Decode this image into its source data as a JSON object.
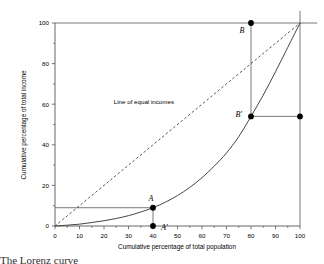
{
  "chart_data": {
    "type": "line",
    "title": "",
    "xlabel": "Cumulative percentage of total population",
    "ylabel": "Cumulative percentage of total income",
    "xlim": [
      0,
      100
    ],
    "ylim": [
      0,
      100
    ],
    "grid": false,
    "legend_position": "none",
    "xticks": [
      0,
      10,
      20,
      30,
      40,
      50,
      60,
      70,
      80,
      90,
      100
    ],
    "xtick_labels": [
      "0",
      "10",
      "20",
      "30",
      "40",
      "50",
      "60",
      "70",
      "80",
      "90",
      "100"
    ],
    "yticks": [
      0,
      20,
      40,
      60,
      80,
      100
    ],
    "ytick_labels": [
      "0",
      "20",
      "40",
      "60",
      "80",
      "100"
    ],
    "ytick_minor": [
      10,
      30,
      50,
      70,
      90
    ],
    "series": [
      {
        "name": "Line of equal incomes",
        "style": "dashed",
        "x": [
          0,
          100
        ],
        "values": [
          0,
          100
        ]
      },
      {
        "name": "Lorenz curve",
        "style": "solid",
        "x": [
          0,
          5,
          10,
          15,
          20,
          25,
          30,
          35,
          40,
          45,
          50,
          55,
          60,
          65,
          70,
          75,
          80,
          85,
          90,
          95,
          100
        ],
        "values": [
          0,
          0.4,
          0.9,
          1.7,
          2.6,
          3.7,
          5.1,
          6.9,
          9.0,
          11.7,
          15.0,
          19.0,
          23.8,
          29.5,
          36.0,
          44.0,
          54.0,
          64.5,
          76.0,
          88.0,
          100.0
        ]
      }
    ],
    "annotations": [
      {
        "name": "line-of-equal-incomes-label",
        "text": "Line of equal incomes",
        "x": 24,
        "y": 60
      }
    ],
    "points": [
      {
        "name": "point-A",
        "label": "A",
        "x": 40,
        "y": 9
      },
      {
        "name": "point-A-prime",
        "label": "A'",
        "x": 40,
        "y": 0
      },
      {
        "name": "point-B",
        "label": "B",
        "x": 80,
        "y": 100
      },
      {
        "name": "point-B-prime",
        "label": "B'",
        "x": 80,
        "y": 54
      },
      {
        "name": "point-right-54",
        "label": "",
        "x": 100,
        "y": 54
      }
    ],
    "reference_lines": [
      {
        "name": "hline-income-9",
        "orientation": "horizontal",
        "value": 9,
        "from": 0,
        "to": 40
      },
      {
        "name": "hline-income-100",
        "orientation": "horizontal",
        "value": 100,
        "from": 0,
        "to": 107
      },
      {
        "name": "hline-income-54",
        "orientation": "horizontal",
        "value": 54,
        "from": 80,
        "to": 100
      },
      {
        "name": "vline-pop-40",
        "orientation": "vertical",
        "value": 40,
        "from": 0,
        "to": 9
      },
      {
        "name": "vline-pop-80",
        "orientation": "vertical",
        "value": 80,
        "from": 54,
        "to": 100
      },
      {
        "name": "vline-pop-100",
        "orientation": "vertical",
        "value": 100,
        "from": 0,
        "to": 106
      }
    ]
  },
  "figure": {
    "caption": "The Lorenz curve"
  }
}
